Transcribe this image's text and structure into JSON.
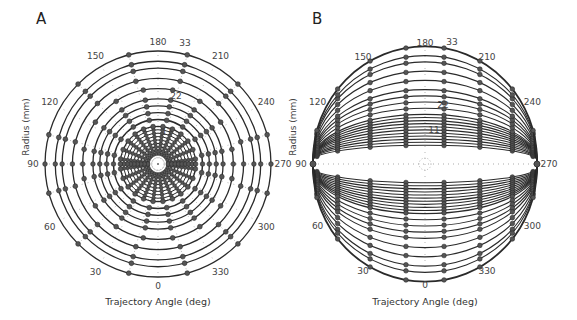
{
  "chart_data": [
    {
      "panel": "A",
      "type": "scatter",
      "projection": "polar",
      "title": "A",
      "xlabel": "Trajectory Angle (deg)",
      "ylabel": "Radius (mm)",
      "angle_ticks": [
        "0",
        "30",
        "60",
        "90",
        "120",
        "150",
        "180",
        "210",
        "240",
        "270",
        "300",
        "330"
      ],
      "radius_ticks": [
        "11",
        "22",
        "33"
      ],
      "radius_range": [
        0,
        33
      ],
      "rings_mm": [
        3,
        4,
        5,
        6,
        7,
        8,
        9,
        10,
        11,
        13,
        15,
        17,
        19,
        22,
        25,
        28,
        30,
        33
      ],
      "marker_angles_deg": [
        0,
        15,
        30,
        45,
        60,
        75,
        90,
        105,
        120,
        135,
        150,
        165,
        180,
        195,
        210,
        225,
        240,
        255,
        270,
        285,
        300,
        315,
        330,
        345
      ],
      "grid": "dotted radial lines",
      "description": "Concentric circular trajectories with sampling markers along radial spokes"
    },
    {
      "panel": "B",
      "type": "scatter",
      "projection": "polar (tilted/ellipse projection)",
      "title": "B",
      "xlabel": "Trajectory Angle (deg)",
      "ylabel": "Radius (mm)",
      "angle_ticks": [
        "0",
        "30",
        "60",
        "90",
        "120",
        "150",
        "180",
        "210",
        "240",
        "270",
        "300",
        "330"
      ],
      "radius_ticks": [
        "11",
        "22",
        "33"
      ],
      "radius_range": [
        0,
        33
      ],
      "rings_mm": [
        1,
        2,
        3,
        4,
        5,
        6,
        7,
        8,
        9,
        10,
        11,
        13,
        15,
        17,
        19,
        22,
        25,
        28,
        30,
        33
      ],
      "marker_columns": 7,
      "description": "Elliptical trajectories sharing horizontal extent, converging at 90 and 270 deg"
    }
  ],
  "panels": {
    "A": {
      "letter": "A",
      "xlabel": "Trajectory Angle (deg)",
      "ylabel": "Radius (mm)"
    },
    "B": {
      "letter": "B",
      "xlabel": "Trajectory Angle (deg)",
      "ylabel": "Radius (mm)"
    }
  },
  "colors": {
    "line": "#2a2a2a",
    "marker_fill": "#555555",
    "grid": "#888888",
    "text": "#444444"
  }
}
